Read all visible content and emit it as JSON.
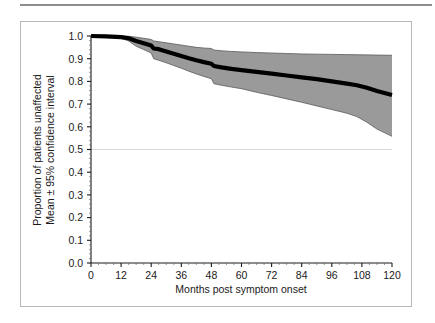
{
  "figure": {
    "background_color": "#ffffff",
    "frame_color": "#b9b9b9",
    "rule_color": "#8d8d8d"
  },
  "chart_data": {
    "type": "line",
    "title": "",
    "subtitle": "",
    "xlabel": "Months post symptom onset",
    "ylabel": "Proportion of patients unaffected\nMean ± 95% confidence interval",
    "ylabel_line1": "Proportion of patients unaffected",
    "ylabel_line2": "Mean ± 95% confidence interval",
    "xlim": [
      0,
      120
    ],
    "ylim": [
      0.0,
      1.0
    ],
    "xticks": [
      0,
      12,
      24,
      36,
      48,
      60,
      72,
      84,
      96,
      108,
      120
    ],
    "xtick_labels": [
      "0",
      "12",
      "24",
      "36",
      "48",
      "60",
      "72",
      "84",
      "96",
      "108",
      "120"
    ],
    "yticks": [
      0.0,
      0.1,
      0.2,
      0.3,
      0.4,
      0.5,
      0.6,
      0.7,
      0.8,
      0.9,
      1.0
    ],
    "ytick_labels": [
      "0.0",
      "0.1",
      "0.2",
      "0.3",
      "0.4",
      "0.5",
      "0.6",
      "0.7",
      "0.8",
      "0.9",
      "1.0"
    ],
    "grid": "horizontal gridline at y=0.50 only",
    "gridlines": [
      0.5
    ],
    "legend": "none",
    "series": [
      {
        "name": "Mean proportion unaffected",
        "style": "thick black line",
        "color": "#000000",
        "x": [
          0,
          6,
          12,
          15,
          18,
          21,
          24,
          25,
          27,
          30,
          33,
          36,
          39,
          42,
          45,
          48,
          49,
          52,
          56,
          60,
          66,
          72,
          78,
          84,
          90,
          96,
          102,
          106,
          110,
          114,
          120
        ],
        "values": [
          1.0,
          0.998,
          0.995,
          0.99,
          0.978,
          0.968,
          0.958,
          0.945,
          0.942,
          0.932,
          0.922,
          0.912,
          0.902,
          0.893,
          0.885,
          0.878,
          0.868,
          0.862,
          0.855,
          0.85,
          0.842,
          0.834,
          0.826,
          0.818,
          0.81,
          0.8,
          0.79,
          0.783,
          0.772,
          0.758,
          0.74
        ]
      },
      {
        "name": "95% confidence interval upper bound",
        "style": "shaded band edge",
        "color": "#9a9a9a",
        "x": [
          0,
          6,
          12,
          15,
          18,
          21,
          24,
          25,
          27,
          30,
          33,
          36,
          39,
          42,
          45,
          48,
          49,
          52,
          56,
          60,
          66,
          72,
          78,
          84,
          90,
          96,
          102,
          108,
          114,
          120
        ],
        "values": [
          1.0,
          1.0,
          1.0,
          0.999,
          0.995,
          0.99,
          0.985,
          0.978,
          0.975,
          0.97,
          0.965,
          0.96,
          0.955,
          0.95,
          0.947,
          0.945,
          0.938,
          0.935,
          0.932,
          0.93,
          0.927,
          0.925,
          0.923,
          0.921,
          0.92,
          0.919,
          0.918,
          0.917,
          0.916,
          0.915
        ]
      },
      {
        "name": "95% confidence interval lower bound",
        "style": "shaded band edge",
        "color": "#9a9a9a",
        "x": [
          0,
          6,
          12,
          15,
          18,
          21,
          24,
          25,
          27,
          30,
          33,
          36,
          39,
          42,
          45,
          48,
          49,
          52,
          56,
          60,
          66,
          72,
          78,
          84,
          90,
          96,
          102,
          106,
          110,
          114,
          120
        ],
        "values": [
          1.0,
          0.996,
          0.99,
          0.978,
          0.955,
          0.94,
          0.925,
          0.9,
          0.893,
          0.882,
          0.87,
          0.858,
          0.845,
          0.833,
          0.822,
          0.812,
          0.79,
          0.783,
          0.775,
          0.768,
          0.752,
          0.738,
          0.723,
          0.708,
          0.692,
          0.676,
          0.66,
          0.645,
          0.62,
          0.59,
          0.558
        ]
      }
    ],
    "band_fill_color": "#9a9a9a",
    "mean_line_color": "#000000",
    "axis_color": "#1a1a1a",
    "annotations": []
  }
}
